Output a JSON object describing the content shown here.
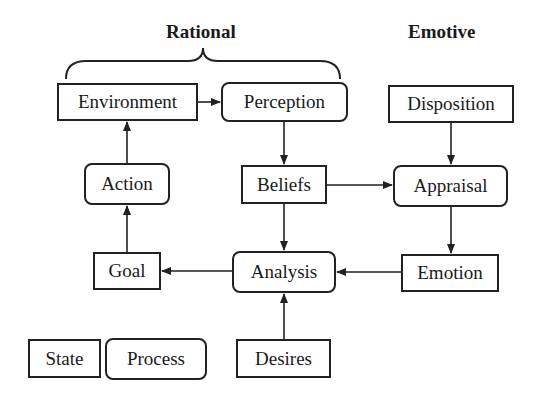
{
  "headings": {
    "rational": "Rational",
    "emotive": "Emotive"
  },
  "nodes": {
    "environment": {
      "label": "Environment",
      "type": "state"
    },
    "perception": {
      "label": "Perception",
      "type": "process"
    },
    "disposition": {
      "label": "Disposition",
      "type": "state"
    },
    "action": {
      "label": "Action",
      "type": "process"
    },
    "beliefs": {
      "label": "Beliefs",
      "type": "state"
    },
    "appraisal": {
      "label": "Appraisal",
      "type": "process"
    },
    "goal": {
      "label": "Goal",
      "type": "state"
    },
    "analysis": {
      "label": "Analysis",
      "type": "process"
    },
    "emotion": {
      "label": "Emotion",
      "type": "state"
    },
    "desires": {
      "label": "Desires",
      "type": "state"
    }
  },
  "legend": {
    "state": "State",
    "process": "Process"
  },
  "edges": [
    {
      "from": "environment",
      "to": "perception"
    },
    {
      "from": "perception",
      "to": "beliefs"
    },
    {
      "from": "disposition",
      "to": "appraisal"
    },
    {
      "from": "beliefs",
      "to": "appraisal"
    },
    {
      "from": "beliefs",
      "to": "analysis"
    },
    {
      "from": "appraisal",
      "to": "emotion"
    },
    {
      "from": "emotion",
      "to": "analysis"
    },
    {
      "from": "analysis",
      "to": "goal"
    },
    {
      "from": "desires",
      "to": "analysis"
    },
    {
      "from": "goal",
      "to": "action"
    },
    {
      "from": "action",
      "to": "environment"
    }
  ],
  "groups": [
    {
      "label": "Rational",
      "spans": [
        "environment",
        "perception"
      ]
    }
  ]
}
